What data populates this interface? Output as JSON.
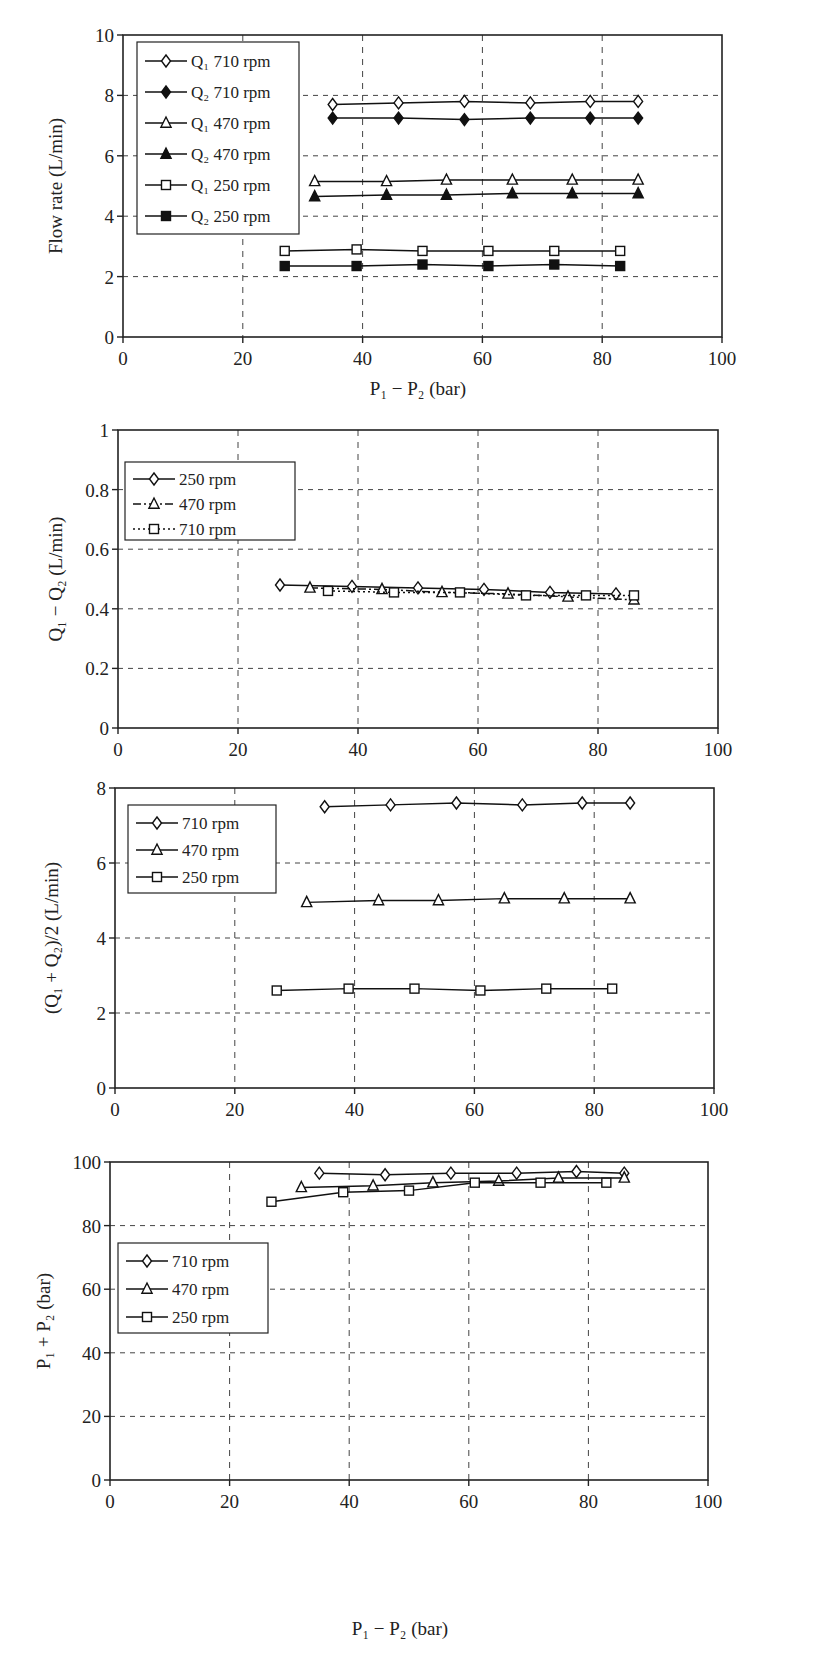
{
  "chart_data": [
    {
      "type": "line",
      "title": "",
      "xlabel": "P1 − P2 (bar)",
      "ylabel": "Flow rate (L/min)",
      "xlim": [
        0,
        100
      ],
      "ylim": [
        0,
        10
      ],
      "xticks": [
        0,
        20,
        40,
        60,
        80,
        100
      ],
      "yticks": [
        0,
        2,
        4,
        6,
        8,
        10
      ],
      "grid": "dashed",
      "legend_position": "upper-left",
      "series": [
        {
          "name": "Q1 710 rpm",
          "marker": "diamond-open",
          "x": [
            35,
            46,
            57,
            68,
            78,
            86
          ],
          "y": [
            7.7,
            7.75,
            7.8,
            7.75,
            7.8,
            7.8
          ]
        },
        {
          "name": "Q2 710 rpm",
          "marker": "diamond-filled",
          "x": [
            35,
            46,
            57,
            68,
            78,
            86
          ],
          "y": [
            7.25,
            7.25,
            7.2,
            7.25,
            7.25,
            7.25
          ]
        },
        {
          "name": "Q1 470 rpm",
          "marker": "triangle-open",
          "x": [
            32,
            44,
            54,
            65,
            75,
            86
          ],
          "y": [
            5.15,
            5.15,
            5.2,
            5.2,
            5.2,
            5.2
          ]
        },
        {
          "name": "Q2 470 rpm",
          "marker": "triangle-filled",
          "x": [
            32,
            44,
            54,
            65,
            75,
            86
          ],
          "y": [
            4.65,
            4.7,
            4.7,
            4.75,
            4.75,
            4.75
          ]
        },
        {
          "name": "Q1 250 rpm",
          "marker": "square-open",
          "x": [
            27,
            39,
            50,
            61,
            72,
            83
          ],
          "y": [
            2.85,
            2.9,
            2.85,
            2.85,
            2.85,
            2.85
          ]
        },
        {
          "name": "Q2 250 rpm",
          "marker": "square-filled",
          "x": [
            27,
            39,
            50,
            61,
            72,
            83
          ],
          "y": [
            2.35,
            2.35,
            2.4,
            2.35,
            2.4,
            2.35
          ]
        }
      ]
    },
    {
      "type": "line",
      "title": "",
      "xlabel": "",
      "ylabel": "Q1 − Q2 (L/min)",
      "xlim": [
        0,
        100
      ],
      "ylim": [
        0,
        1
      ],
      "xticks": [
        0,
        20,
        40,
        60,
        80,
        100
      ],
      "yticks": [
        0,
        0.2,
        0.4,
        0.6,
        0.8,
        1
      ],
      "grid": "dashed",
      "legend_position": "upper-left",
      "series": [
        {
          "name": "250 rpm",
          "marker": "diamond-open",
          "line": "solid",
          "x": [
            27,
            39,
            50,
            61,
            72,
            83
          ],
          "y": [
            0.48,
            0.475,
            0.47,
            0.465,
            0.455,
            0.45
          ]
        },
        {
          "name": "470 rpm",
          "marker": "triangle-open",
          "line": "dash-dot",
          "x": [
            32,
            44,
            54,
            65,
            75,
            86
          ],
          "y": [
            0.47,
            0.465,
            0.455,
            0.45,
            0.44,
            0.43
          ]
        },
        {
          "name": "710 rpm",
          "marker": "square-open",
          "line": "dotted",
          "x": [
            35,
            46,
            57,
            68,
            78,
            86
          ],
          "y": [
            0.46,
            0.455,
            0.455,
            0.445,
            0.445,
            0.445
          ]
        }
      ]
    },
    {
      "type": "line",
      "title": "",
      "xlabel": "",
      "ylabel": "(Q1 + Q2)/2 (L/min)",
      "xlim": [
        0,
        100
      ],
      "ylim": [
        0,
        8
      ],
      "xticks": [
        0,
        20,
        40,
        60,
        80,
        100
      ],
      "yticks": [
        0,
        2,
        4,
        6,
        8
      ],
      "grid": "dashed",
      "legend_position": "upper-left",
      "series": [
        {
          "name": "710 rpm",
          "marker": "diamond-open",
          "x": [
            35,
            46,
            57,
            68,
            78,
            86
          ],
          "y": [
            7.5,
            7.55,
            7.6,
            7.55,
            7.6,
            7.6
          ]
        },
        {
          "name": "470 rpm",
          "marker": "triangle-open",
          "x": [
            32,
            44,
            54,
            65,
            75,
            86
          ],
          "y": [
            4.95,
            5.0,
            5.0,
            5.05,
            5.05,
            5.05
          ]
        },
        {
          "name": "250 rpm",
          "marker": "square-open",
          "x": [
            27,
            39,
            50,
            61,
            72,
            83
          ],
          "y": [
            2.6,
            2.65,
            2.65,
            2.6,
            2.65,
            2.65
          ]
        }
      ]
    },
    {
      "type": "line",
      "title": "",
      "xlabel": "P1 − P2 (bar)",
      "ylabel": "P1 + P2 (bar)",
      "xlim": [
        0,
        100
      ],
      "ylim": [
        0,
        100
      ],
      "xticks": [
        0,
        20,
        40,
        60,
        80,
        100
      ],
      "yticks": [
        0,
        20,
        40,
        60,
        80,
        100
      ],
      "grid": "dashed",
      "legend_position": "center-left",
      "series": [
        {
          "name": "710 rpm",
          "marker": "diamond-open",
          "x": [
            35,
            46,
            57,
            68,
            78,
            86
          ],
          "y": [
            96.5,
            96,
            96.5,
            96.5,
            97,
            96.5
          ]
        },
        {
          "name": "470 rpm",
          "marker": "triangle-open",
          "x": [
            32,
            44,
            54,
            65,
            75,
            86
          ],
          "y": [
            92,
            92.5,
            93.5,
            94,
            95,
            95
          ]
        },
        {
          "name": "250 rpm",
          "marker": "square-open",
          "x": [
            27,
            39,
            50,
            61,
            72,
            83
          ],
          "y": [
            87.5,
            90.5,
            91,
            93.5,
            93.5,
            93.5
          ]
        }
      ]
    }
  ],
  "charts": [
    {
      "ylabel": "Flow rate (L/min)",
      "xlabel_main": "P",
      "legend": [
        "Q₁ 710 rpm",
        "Q₂ 710 rpm",
        "Q₁ 470 rpm",
        "Q₂ 470 rpm",
        "Q₁ 250 rpm",
        "Q₂ 250 rpm"
      ],
      "ytick_labels": [
        "0",
        "2",
        "4",
        "6",
        "8",
        "10"
      ],
      "xtick_labels": [
        "0",
        "20",
        "40",
        "60",
        "80",
        "100"
      ]
    },
    {
      "ylabel": "Q₁ − Q₂  (L/min)",
      "legend": [
        "250 rpm",
        "470 rpm",
        "710 rpm"
      ],
      "ytick_labels": [
        "0",
        "0.2",
        "0.4",
        "0.6",
        "0.8",
        "1"
      ],
      "xtick_labels": [
        "0",
        "20",
        "40",
        "60",
        "80",
        "100"
      ]
    },
    {
      "ylabel": "(Q₁ + Q₂)/2  (L/min)",
      "legend": [
        "710 rpm",
        "470 rpm",
        "250 rpm"
      ],
      "ytick_labels": [
        "0",
        "2",
        "4",
        "6",
        "8"
      ],
      "xtick_labels": [
        "0",
        "20",
        "40",
        "60",
        "80",
        "100"
      ]
    },
    {
      "ylabel": "P₁ + P₂ (bar)",
      "legend": [
        "710  rpm",
        "470  rpm",
        "250 rpm"
      ],
      "ytick_labels": [
        "0",
        "20",
        "40",
        "60",
        "80",
        "100"
      ],
      "xtick_labels": [
        "0",
        "20",
        "40",
        "60",
        "80",
        "100"
      ]
    }
  ],
  "xaxis_label": "P₁ − P₂ (bar)"
}
